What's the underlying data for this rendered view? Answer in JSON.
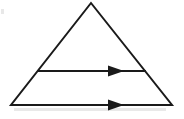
{
  "figure": {
    "title": "Triangle with two horizontal arrows",
    "background_color": "#ffffff",
    "stroke_color": "#1a1a1a",
    "stroke_width": 2,
    "canvas": {
      "width": 184,
      "height": 119
    },
    "shapes": {
      "triangle": {
        "label": "triangle",
        "vertices": {
          "apex": {
            "x": 91,
            "y": 3
          },
          "bottom_left": {
            "x": 11,
            "y": 105
          },
          "bottom_right": {
            "x": 172,
            "y": 105
          }
        },
        "points": "91,3 172,105 11,105",
        "fill": "none"
      },
      "upper_arrow": {
        "label": "upper-arrow",
        "direction": "right",
        "line": {
          "x1": 37,
          "y1": 71,
          "x2": 146,
          "y2": 71
        },
        "head": {
          "points": "124,71 108,65.5 108,76.5",
          "tip_x": 124,
          "tip_y": 71
        }
      },
      "lower_arrow": {
        "label": "lower-arrow",
        "direction": "right",
        "line": {
          "x1": 11,
          "y1": 105,
          "x2": 172,
          "y2": 105
        },
        "head": {
          "points": "124,105 108,99.5 108,110.5",
          "tip_x": 124,
          "tip_y": 105
        }
      }
    },
    "artifacts": {
      "base_smudge": {
        "x": 14,
        "y": 108,
        "width": 152,
        "height": 3
      },
      "left_speck": {
        "x": 1,
        "y": 9,
        "width": 3,
        "height": 5
      }
    }
  }
}
